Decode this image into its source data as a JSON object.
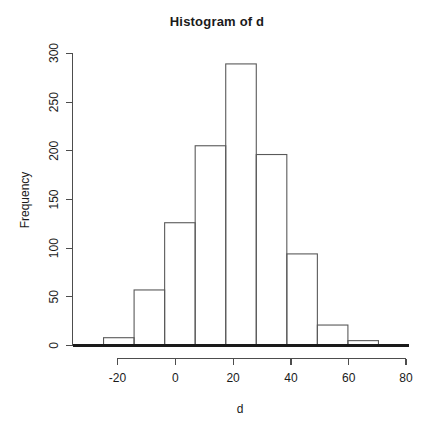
{
  "chart_data": {
    "type": "bar",
    "title": "Histogram of d",
    "xlabel": "d",
    "ylabel": "Frequency",
    "bin_width": 10,
    "bin_edges": [
      -20,
      -10,
      0,
      10,
      20,
      30,
      40,
      50,
      60,
      70
    ],
    "categories": [
      "-20 to -10",
      "-10 to 0",
      "0 to 10",
      "10 to 20",
      "20 to 30",
      "30 to 40",
      "40 to 50",
      "50 to 60",
      "60 to 70"
    ],
    "values": [
      8,
      57,
      126,
      205,
      289,
      196,
      94,
      21,
      5
    ],
    "xlim": [
      -30,
      80
    ],
    "ylim": [
      0,
      300
    ],
    "xticks": [
      -20,
      0,
      20,
      40,
      60,
      80
    ],
    "xtick_labels": [
      "-20",
      "0",
      "20",
      "40",
      "60",
      "80"
    ],
    "yticks": [
      0,
      50,
      100,
      150,
      200,
      250,
      300
    ],
    "ytick_labels": [
      "0",
      "50",
      "100",
      "150",
      "200",
      "250",
      "300"
    ],
    "grid": false,
    "legend": false,
    "axis_color": "#4d4d4d",
    "bar_stroke": "#595959",
    "text_color": "#1a1a1a"
  },
  "labels": {
    "title": "Histogram of d",
    "x_axis_title": "d",
    "y_axis_title": "Frequency"
  }
}
